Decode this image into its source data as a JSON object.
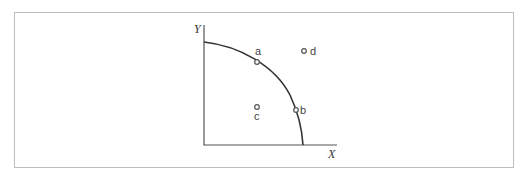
{
  "diagram": {
    "type": "production-possibility-frontier",
    "axes": {
      "x_label": "X",
      "y_label": "Y"
    },
    "curve": {
      "description": "concave frontier from Y-axis intercept to X-axis intercept",
      "color": "#333333"
    },
    "points": [
      {
        "id": "a",
        "label": "a",
        "position": "on curve"
      },
      {
        "id": "b",
        "label": "b",
        "position": "on curve"
      },
      {
        "id": "c",
        "label": "c",
        "position": "inside curve"
      },
      {
        "id": "d",
        "label": "d",
        "position": "outside curve"
      }
    ]
  }
}
